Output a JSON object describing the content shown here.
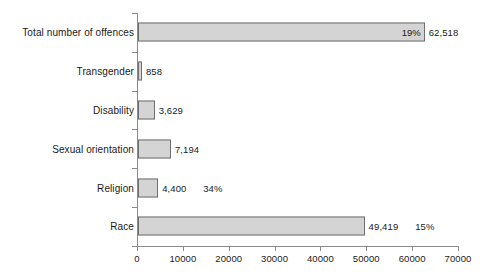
{
  "chart_data": {
    "type": "bar",
    "orientation": "horizontal",
    "title": "",
    "subtitle": "",
    "xlabel": "",
    "ylabel": "",
    "xlim": [
      0,
      70000
    ],
    "grid": false,
    "legend": "none",
    "xticks": [
      0,
      10000,
      20000,
      30000,
      40000,
      50000,
      60000,
      70000
    ],
    "xtick_labels": [
      "0",
      "10000",
      "20000",
      "30000",
      "40000",
      "50000",
      "60000",
      "70000"
    ],
    "categories": [
      "Total number of offences",
      "Transgender",
      "Disability",
      "Sexual orientation",
      "Religion",
      "Race"
    ],
    "values": [
      62518,
      858,
      3629,
      7194,
      4400,
      49419
    ],
    "value_labels": [
      "62,518",
      "858",
      "3,629",
      "7,194",
      "4,400",
      "49,419"
    ],
    "annotations": [
      {
        "category": "Total number of offences",
        "text": "19%",
        "position": "inside-end"
      },
      {
        "category": "Religion",
        "text": "34%",
        "position": "outside-after-value"
      },
      {
        "category": "Race",
        "text": "15%",
        "position": "outside-after-value"
      }
    ],
    "bar_fill": "#d4d4d4",
    "bar_stroke": "#6e6e6e",
    "axis_color": "#8a8a8a",
    "text_color": "#1a1a1a"
  },
  "rows": [
    {
      "label": "Total number of offences",
      "value_label": "62,518",
      "inside_pct": "19%",
      "outside_pct": ""
    },
    {
      "label": "Transgender",
      "value_label": "858",
      "inside_pct": "",
      "outside_pct": ""
    },
    {
      "label": "Disability",
      "value_label": "3,629",
      "inside_pct": "",
      "outside_pct": ""
    },
    {
      "label": "Sexual orientation",
      "value_label": "7,194",
      "inside_pct": "",
      "outside_pct": ""
    },
    {
      "label": "Religion",
      "value_label": "4,400",
      "inside_pct": "",
      "outside_pct": "34%"
    },
    {
      "label": "Race",
      "value_label": "49,419",
      "inside_pct": "",
      "outside_pct": "15%"
    }
  ]
}
